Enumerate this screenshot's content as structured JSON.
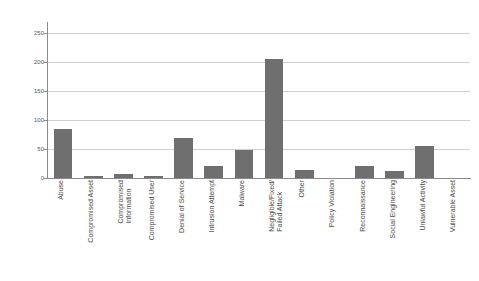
{
  "chart_data": {
    "type": "bar",
    "title": "",
    "subtitle": "",
    "xlabel": "",
    "ylabel": "",
    "ylim": [
      0,
      265
    ],
    "yticks": [
      0,
      50,
      100,
      150,
      200,
      250
    ],
    "ytick_labels": [
      "0",
      "50",
      "100",
      "150",
      "200",
      "250"
    ],
    "grid": true,
    "legend": false,
    "legend_position": "none",
    "bar_color": "#6f6f6f",
    "axis_color": "#8a8a8a",
    "gridline_color": "#cfcfcf",
    "categories": [
      "Abuse",
      "Compromised Asset",
      "Compromised Information",
      "Compromised User",
      "Denial of Service",
      "Intrusion Attempt",
      "Malware",
      "Negligible/Fixed/Failed Attack",
      "Other",
      "Policy Violation",
      "Reconnaissance",
      "Social Engineering",
      "Unlawful Activity",
      "Vulnerable Asset"
    ],
    "category_label_lines": [
      [
        "Abuse"
      ],
      [
        "Compromised Asset"
      ],
      [
        "Compromised",
        "Information"
      ],
      [
        "Compromised User"
      ],
      [
        "Denial of Service"
      ],
      [
        "Intrusion Attempt"
      ],
      [
        "Malware"
      ],
      [
        "Negligible/Fixed/",
        "Failed Attack"
      ],
      [
        "Other"
      ],
      [
        "Policy Violation"
      ],
      [
        "Reconnaissance"
      ],
      [
        "Social Engineering"
      ],
      [
        "Unlawful Activity"
      ],
      [
        "Vulnerable Asset"
      ]
    ],
    "values": [
      85,
      4,
      7,
      4,
      69,
      21,
      48,
      205,
      13,
      0,
      20,
      12,
      55,
      0
    ]
  }
}
